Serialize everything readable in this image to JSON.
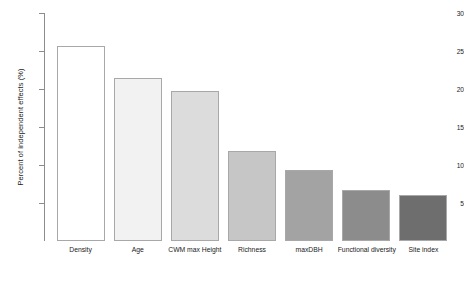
{
  "chart_data": {
    "type": "bar",
    "title": "",
    "xlabel": "",
    "ylabel": "Percent of independent effects (%)",
    "ylim": [
      0,
      30
    ],
    "grid": false,
    "legend": "none",
    "ytick_labels": [
      "30",
      "25",
      "20",
      "15",
      "10",
      "5"
    ],
    "ytick_values": [
      30,
      25,
      20,
      15,
      10,
      5
    ],
    "categories": [
      "Density",
      "Age",
      "CWM max Height",
      "Richness",
      "maxDBH",
      "Functional diversity",
      "Site index"
    ],
    "values": [
      25.7,
      21.5,
      19.8,
      11.8,
      9.3,
      6.7,
      6.0
    ],
    "bar_colors": [
      "#ffffff",
      "#f2f2f2",
      "#dcdcdc",
      "#c6c6c6",
      "#a3a3a3",
      "#8c8c8c",
      "#6e6e6e"
    ],
    "bar_border_color": "#a8a8a8",
    "axis_color": "#8c8c8c",
    "background_color": "#ffffff"
  }
}
